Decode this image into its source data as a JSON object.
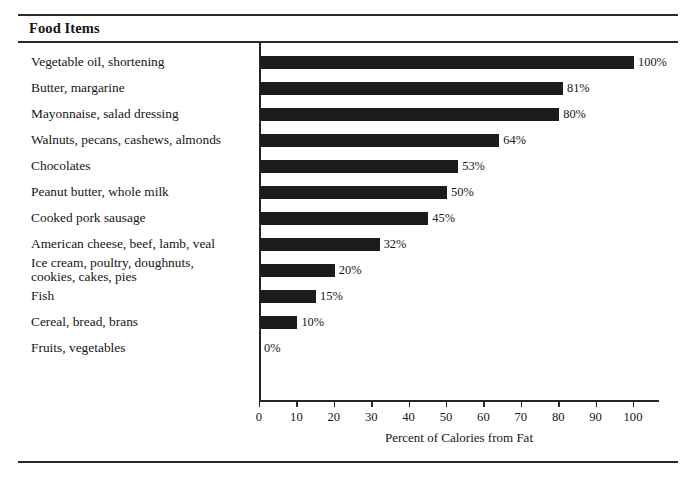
{
  "header": {
    "title": "Food Items"
  },
  "chart_data": {
    "type": "bar",
    "orientation": "horizontal",
    "title": "Food Items",
    "xlabel": "Percent of Calories from Fat",
    "ylabel": "",
    "xlim": [
      0,
      100
    ],
    "xticks": [
      0,
      10,
      20,
      30,
      40,
      50,
      60,
      70,
      80,
      90,
      100
    ],
    "xtick_labels": [
      "0",
      "10",
      "20",
      "30",
      "40",
      "50",
      "60",
      "70",
      "80",
      "90",
      "100"
    ],
    "grid": false,
    "legend": false,
    "bar_color": "#1c1c1c",
    "categories": [
      "Vegetable oil, shortening",
      "Butter, margarine",
      "Mayonnaise, salad dressing",
      "Walnuts, pecans, cashews, almonds",
      "Chocolates",
      "Peanut butter, whole milk",
      "Cooked pork sausage",
      "American cheese, beef, lamb, veal",
      "Ice cream, poultry, doughnuts, cookies, cakes, pies",
      "Fish",
      "Cereal, bread, brans",
      "Fruits, vegetables"
    ],
    "values": [
      100,
      81,
      80,
      64,
      53,
      50,
      45,
      32,
      20,
      15,
      10,
      0
    ],
    "value_labels": [
      "100%",
      "81%",
      "80%",
      "64%",
      "53%",
      "50%",
      "45%",
      "32%",
      "20%",
      "15%",
      "10%",
      "0%"
    ]
  },
  "rows": [
    {
      "label_lines": [
        "Vegetable oil, shortening"
      ],
      "value": 100,
      "value_label": "100%"
    },
    {
      "label_lines": [
        "Butter, margarine"
      ],
      "value": 81,
      "value_label": "81%"
    },
    {
      "label_lines": [
        "Mayonnaise, salad dressing"
      ],
      "value": 80,
      "value_label": "80%"
    },
    {
      "label_lines": [
        "Walnuts, pecans, cashews, almonds"
      ],
      "value": 64,
      "value_label": "64%"
    },
    {
      "label_lines": [
        "Chocolates"
      ],
      "value": 53,
      "value_label": "53%"
    },
    {
      "label_lines": [
        "Peanut butter, whole milk"
      ],
      "value": 50,
      "value_label": "50%"
    },
    {
      "label_lines": [
        "Cooked pork sausage"
      ],
      "value": 45,
      "value_label": "45%"
    },
    {
      "label_lines": [
        "American cheese, beef, lamb, veal"
      ],
      "value": 32,
      "value_label": "32%"
    },
    {
      "label_lines": [
        "Ice cream, poultry, doughnuts,",
        "cookies, cakes, pies"
      ],
      "value": 20,
      "value_label": "20%"
    },
    {
      "label_lines": [
        "Fish"
      ],
      "value": 15,
      "value_label": "15%"
    },
    {
      "label_lines": [
        "Cereal, bread, brans"
      ],
      "value": 10,
      "value_label": "10%"
    },
    {
      "label_lines": [
        "Fruits, vegetables"
      ],
      "value": 0,
      "value_label": "0%"
    }
  ],
  "axis": {
    "title": "Percent of Calories from Fat"
  }
}
